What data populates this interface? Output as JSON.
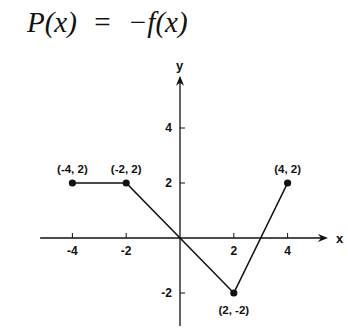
{
  "title": {
    "lhs": "P(x)",
    "eq": "=",
    "rhs": "−f(x)"
  },
  "chart_data": {
    "type": "line",
    "title": "P(x) = −f(x)",
    "xlabel": "x",
    "ylabel": "y",
    "x_ticks": [
      -4,
      -2,
      2,
      4
    ],
    "y_ticks": [
      4,
      2,
      -2
    ],
    "xlim": [
      -5.2,
      5.5
    ],
    "ylim": [
      -3.2,
      5.9
    ],
    "grid": false,
    "series": [
      {
        "name": "P(x)",
        "x": [
          -4,
          -2,
          2,
          4
        ],
        "y": [
          2,
          2,
          -2,
          2
        ]
      }
    ],
    "annotations": [
      {
        "label": "(-4, 2)",
        "x": -4,
        "y": 2
      },
      {
        "label": "(-2, 2)",
        "x": -2,
        "y": 2
      },
      {
        "label": "(2, -2)",
        "x": 2,
        "y": -2
      },
      {
        "label": "(4, 2)",
        "x": 4,
        "y": 2
      }
    ]
  },
  "colors": {
    "ink": "#111111",
    "background": "#ffffff"
  }
}
